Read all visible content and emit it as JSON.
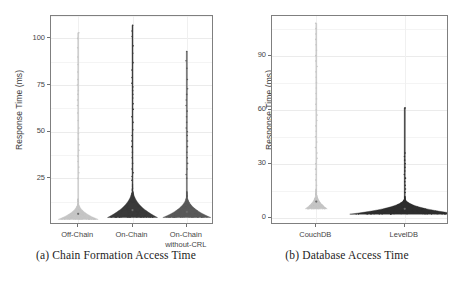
{
  "figure": {
    "panels": [
      {
        "id": "panel-a",
        "caption": "(a) Chain Formation Access Time",
        "ylabel": "Response Time (ms)",
        "yticks": [
          "25",
          "50",
          "75",
          "100"
        ],
        "ytick_values": [
          25,
          50,
          75,
          100
        ],
        "ylim": [
          0,
          112
        ],
        "categories": [
          "Off-Chain",
          "On-Chain",
          "On-Chain\nwithout-CRL"
        ],
        "colors": [
          "#c6c6c6",
          "#3a3a3a",
          "#595959"
        ]
      },
      {
        "id": "panel-b",
        "caption": "(b) Database Access Time",
        "ylabel": "Response Time (ms)",
        "yticks": [
          "0",
          "30",
          "60",
          "90"
        ],
        "ytick_values": [
          0,
          30,
          60,
          90
        ],
        "ylim": [
          -4,
          112
        ],
        "categories": [
          "CouchDB",
          "LevelDB"
        ],
        "colors": [
          "#c6c6c6",
          "#2e2e2e"
        ]
      }
    ]
  },
  "chart_data": [
    {
      "type": "violin",
      "title": "(a) Chain Formation Access Time",
      "xlabel": "",
      "ylabel": "Response Time (ms)",
      "ylim": [
        0,
        112
      ],
      "ytick_labels": [
        "25",
        "50",
        "75",
        "100"
      ],
      "grid": true,
      "legend": "none",
      "categories": [
        "Off-Chain",
        "On-Chain",
        "On-Chain without-CRL"
      ],
      "series": [
        {
          "name": "Off-Chain",
          "color": "#c6c6c6",
          "median": 6,
          "q1": 5,
          "q3": 8,
          "min": 3,
          "max": 103,
          "body_top": 14,
          "spike_top": 103,
          "halfwidth_max": 20,
          "outliers": [
            25,
            28,
            31,
            34,
            37,
            40,
            43,
            46,
            49,
            52,
            56,
            60,
            64,
            67,
            70,
            72,
            75,
            78,
            82,
            86,
            90,
            95,
            100,
            103
          ]
        },
        {
          "name": "On-Chain",
          "color": "#3a3a3a",
          "median": 8,
          "q1": 6,
          "q3": 11,
          "min": 4,
          "max": 107,
          "body_top": 22,
          "spike_top": 107,
          "halfwidth_max": 25,
          "outliers": [
            24,
            26,
            28,
            30,
            33,
            36,
            39,
            42,
            45,
            48,
            51,
            55,
            58,
            62,
            65,
            68,
            70,
            72,
            74,
            76,
            79,
            83,
            87,
            92,
            96,
            101,
            104,
            107
          ]
        },
        {
          "name": "On-Chain without-CRL",
          "color": "#595959",
          "median": 7,
          "q1": 6,
          "q3": 10,
          "min": 4,
          "max": 93,
          "body_top": 18,
          "spike_top": 93,
          "halfwidth_max": 24,
          "outliers": [
            25,
            27,
            30,
            33,
            36,
            39,
            42,
            45,
            48,
            50,
            52,
            55,
            58,
            61,
            64,
            67,
            70,
            73,
            78,
            84,
            88,
            93
          ]
        }
      ]
    },
    {
      "type": "violin",
      "title": "(b) Database Access Time",
      "xlabel": "",
      "ylabel": "Response Time (ms)",
      "ylim": [
        -4,
        112
      ],
      "ytick_labels": [
        "0",
        "30",
        "60",
        "90"
      ],
      "grid": true,
      "legend": "none",
      "categories": [
        "CouchDB",
        "LevelDB"
      ],
      "series": [
        {
          "name": "CouchDB",
          "color": "#c6c6c6",
          "median": 9,
          "q1": 7,
          "q3": 11,
          "min": 5,
          "max": 108,
          "body_top": 16,
          "spike_top": 108,
          "halfwidth_max": 11,
          "outliers": [
            18,
            21,
            24,
            27,
            30,
            33,
            36,
            39,
            42,
            45,
            48,
            51,
            54,
            57,
            60,
            63,
            66,
            69,
            72,
            75,
            78,
            81,
            84,
            87,
            90,
            93,
            96,
            99,
            102,
            105,
            108
          ]
        },
        {
          "name": "LevelDB",
          "color": "#2e2e2e",
          "median": 5,
          "q1": 4,
          "q3": 7,
          "min": 2,
          "max": 61,
          "body_top": 12,
          "spike_top": 61,
          "halfwidth_max": 55,
          "outliers": [
            14,
            16,
            18,
            20,
            22,
            24,
            26,
            28,
            30,
            32,
            34,
            36,
            61
          ]
        }
      ]
    }
  ]
}
